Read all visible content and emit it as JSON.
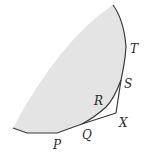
{
  "diagram": {
    "type": "geometric-region",
    "fill_color": "#e4e4e4",
    "stroke_color": "#3a3a3a",
    "labels": {
      "T": "T",
      "S": "S",
      "R": "R",
      "X": "X",
      "Q": "Q",
      "P": "P"
    }
  }
}
